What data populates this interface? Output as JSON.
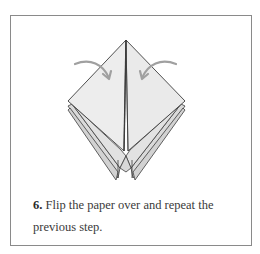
{
  "figure": {
    "step_number": "6.",
    "caption_text": "Flip the paper over and repeat the previous step.",
    "caption_line1": "Flip the paper over and repeat the",
    "caption_line2": "previous step.",
    "diagram": {
      "subject": "origami-folded-diamond",
      "arrows": [
        "curved-arrow-left-to-center",
        "curved-arrow-right-to-center"
      ],
      "colors": {
        "paper_front": "#ececec",
        "paper_back_layers": "#dcdcdc",
        "outline": "#3c3c3c",
        "arrow": "#9a9a9a",
        "frame_border": "#8a8a8a"
      }
    }
  }
}
